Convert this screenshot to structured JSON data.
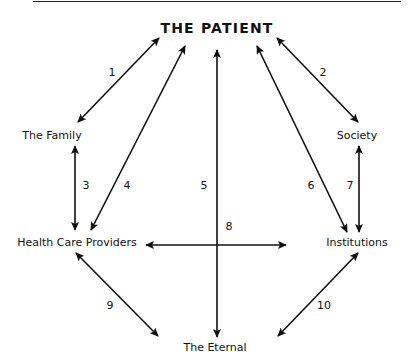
{
  "diagram": {
    "center": "THE PATIENT",
    "nodes": {
      "family": "The Family",
      "society": "Society",
      "providers": "Health Care Providers",
      "institutions": "Institutions",
      "eternal": "The Eternal"
    },
    "relationships": [
      {
        "id": "1",
        "from": "THE PATIENT",
        "to": "The Family",
        "direction": "bidirectional"
      },
      {
        "id": "2",
        "from": "THE PATIENT",
        "to": "Society",
        "direction": "bidirectional"
      },
      {
        "id": "3",
        "from": "The Family",
        "to": "Health Care Providers",
        "direction": "bidirectional"
      },
      {
        "id": "4",
        "from": "THE PATIENT",
        "to": "Health Care Providers",
        "direction": "bidirectional"
      },
      {
        "id": "5",
        "from": "THE PATIENT",
        "to": "The Eternal",
        "direction": "bidirectional"
      },
      {
        "id": "6",
        "from": "THE PATIENT",
        "to": "Institutions",
        "direction": "bidirectional"
      },
      {
        "id": "7",
        "from": "Society",
        "to": "Institutions",
        "direction": "bidirectional"
      },
      {
        "id": "8",
        "from": "Health Care Providers",
        "to": "Institutions",
        "direction": "bidirectional"
      },
      {
        "id": "9",
        "from": "Health Care Providers",
        "to": "The Eternal",
        "direction": "bidirectional"
      },
      {
        "id": "10",
        "from": "Institutions",
        "to": "The Eternal",
        "direction": "bidirectional"
      }
    ],
    "labels": {
      "n1": "1",
      "n2": "2",
      "n3": "3",
      "n4": "4",
      "n5": "5",
      "n6": "6",
      "n7": "7",
      "n8": "8",
      "n9": "9",
      "n10": "10"
    },
    "colors": {
      "line": "#111111",
      "background": "#ffffff"
    }
  }
}
